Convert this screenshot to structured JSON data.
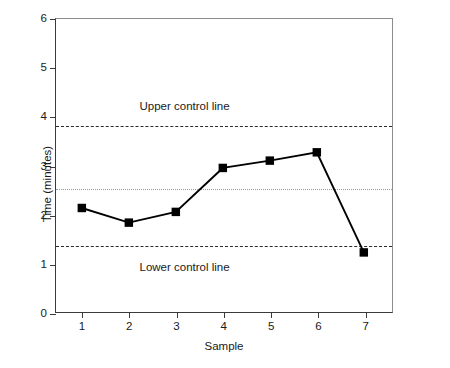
{
  "chart_data": {
    "type": "line",
    "title": "",
    "xlabel": "Sample",
    "ylabel": "Time (minutes)",
    "x": [
      1,
      2,
      3,
      4,
      5,
      6,
      7
    ],
    "values": [
      2.13,
      1.83,
      2.05,
      2.95,
      3.1,
      3.27,
      1.22
    ],
    "series": [
      {
        "name": "Time",
        "values": [
          2.13,
          1.83,
          2.05,
          2.95,
          3.1,
          3.27,
          1.22
        ],
        "marker": "square",
        "color": "#000000"
      }
    ],
    "xlim": [
      0.45,
      7.6
    ],
    "ylim": [
      0,
      6
    ],
    "xticks": [
      1,
      2,
      3,
      4,
      5,
      6,
      7
    ],
    "yticks": [
      0,
      1,
      2,
      3,
      4,
      5,
      6
    ],
    "xticklabels": [
      "1",
      "2",
      "3",
      "4",
      "5",
      "6",
      "7"
    ],
    "yticklabels": [
      "0",
      "1",
      "2",
      "3",
      "4",
      "5",
      "6"
    ],
    "grid": false,
    "legend": "none",
    "reference_lines": [
      {
        "name": "upper-control-line",
        "label": "Upper control line",
        "value": 3.83,
        "style": "dashed",
        "color": "#2b2b2b",
        "label_x": 3.17,
        "label_y": 4.22
      },
      {
        "name": "center-line",
        "label": "",
        "value": 2.55,
        "style": "dotted",
        "color": "#9a9a9a"
      },
      {
        "name": "lower-control-line",
        "label": "Lower control line",
        "value": 1.38,
        "style": "dashed",
        "color": "#2b2b2b",
        "label_x": 3.17,
        "label_y": 0.93
      }
    ]
  }
}
